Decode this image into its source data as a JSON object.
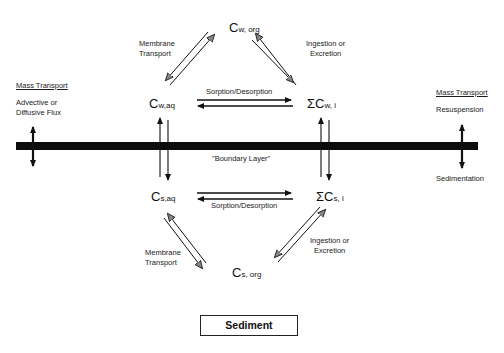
{
  "diagram": {
    "nodes": {
      "cw_org": {
        "symbol": "C",
        "subscript": "w, org",
        "prefix": ""
      },
      "cw_aq": {
        "symbol": "C",
        "subscript": "w,aq",
        "prefix": ""
      },
      "cw_i": {
        "symbol": "C",
        "subscript": "w, i",
        "prefix": "Σ"
      },
      "cs_aq": {
        "symbol": "C",
        "subscript": "s,aq",
        "prefix": ""
      },
      "cs_i": {
        "symbol": "C",
        "subscript": "s, i",
        "prefix": "Σ"
      },
      "cs_org": {
        "symbol": "C",
        "subscript": "s, org",
        "prefix": ""
      }
    },
    "edge_labels": {
      "upper_left": [
        "Membrane",
        "Transport"
      ],
      "upper_right": [
        "Ingestion or",
        "Excretion"
      ],
      "upper_middle": "Sorption/Desorption",
      "lower_middle": "Sorption/Desorption",
      "lower_left": [
        "Membrane",
        "Transport"
      ],
      "lower_right": [
        "Ingestion or",
        "Excretion"
      ]
    },
    "boundary_label": "\"Boundary Layer\"",
    "left_side": {
      "heading": "Mass Transport",
      "lines": [
        "Advective or",
        "Diffusive Flux"
      ]
    },
    "right_side": {
      "heading": "Mass Transport",
      "top": "Resuspension",
      "bottom": "Sedimentation"
    },
    "sediment_label": "Sediment",
    "colors": {
      "ink": "#111111",
      "arrow_fill": "#777777",
      "background": "#ffffff"
    }
  }
}
